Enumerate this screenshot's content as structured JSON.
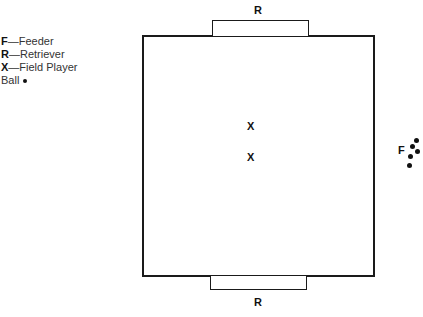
{
  "legend": {
    "items": [
      {
        "symbol": "F",
        "dash": "—",
        "label": "Feeder"
      },
      {
        "symbol": "R",
        "dash": "—",
        "label": "Retriever"
      },
      {
        "symbol": "X",
        "dash": "—",
        "label": "Field Player"
      }
    ],
    "ball_label": "Ball"
  },
  "field": {
    "top_goal_label": "R",
    "bottom_goal_label": "R",
    "players": [
      {
        "symbol": "X",
        "x": 247,
        "y": 121
      },
      {
        "symbol": "X",
        "x": 247,
        "y": 152
      }
    ],
    "feeder": {
      "symbol": "F",
      "x": 398,
      "y": 145
    },
    "balls": [
      {
        "x": 414,
        "y": 138
      },
      {
        "x": 410,
        "y": 144
      },
      {
        "x": 415,
        "y": 149
      },
      {
        "x": 408,
        "y": 154
      },
      {
        "x": 407,
        "y": 163
      }
    ]
  }
}
